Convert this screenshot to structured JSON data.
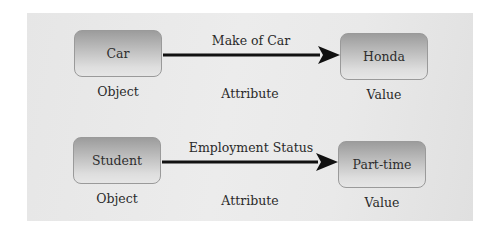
{
  "diagram": {
    "title": "",
    "rows": [
      {
        "object": "Car",
        "attribute": "Make of Car",
        "value": "Honda",
        "captions": {
          "object": "Object",
          "attribute": "Attribute",
          "value": "Value"
        }
      },
      {
        "object": "Student",
        "attribute": "Employment Status",
        "value": "Part-time",
        "captions": {
          "object": "Object",
          "attribute": "Attribute",
          "value": "Value"
        }
      }
    ],
    "colors": {
      "panel": "#e8e8e8",
      "node_top": "#9c9c9c",
      "node_bottom": "#e6e6e6",
      "arrow": "#111111",
      "text": "#2a2a2a"
    }
  }
}
